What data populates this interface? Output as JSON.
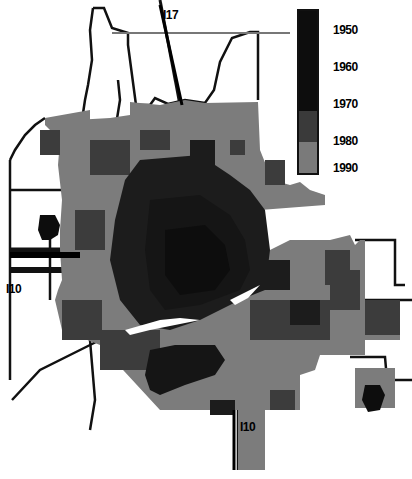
{
  "map": {
    "subject": "Urban growth by decade",
    "highway_labels": [
      {
        "id": "i17",
        "text": "I17",
        "x": 163,
        "y": 12
      },
      {
        "id": "i10-west",
        "text": "I10",
        "x": 4,
        "y": 287
      },
      {
        "id": "i10-south",
        "text": "I10",
        "x": 240,
        "y": 420
      }
    ],
    "legend": {
      "items": [
        {
          "label": "1950",
          "color": "#0d0d0d",
          "top": 14
        },
        {
          "label": "1960",
          "color": "#151515",
          "top": 51
        },
        {
          "label": "1970",
          "color": "#1c1c1c",
          "top": 88
        },
        {
          "label": "1980",
          "color": "#3a3a3a",
          "top": 125
        },
        {
          "label": "1990",
          "color": "#7a7a7a",
          "top": 159
        }
      ]
    },
    "colors": {
      "background": "#ffffff",
      "boundary": "#111111",
      "c1950": "#0d0d0d",
      "c1960": "#151515",
      "c1970": "#1c1c1c",
      "c1980": "#3c3c3c",
      "c1990": "#7c7c7c"
    }
  }
}
